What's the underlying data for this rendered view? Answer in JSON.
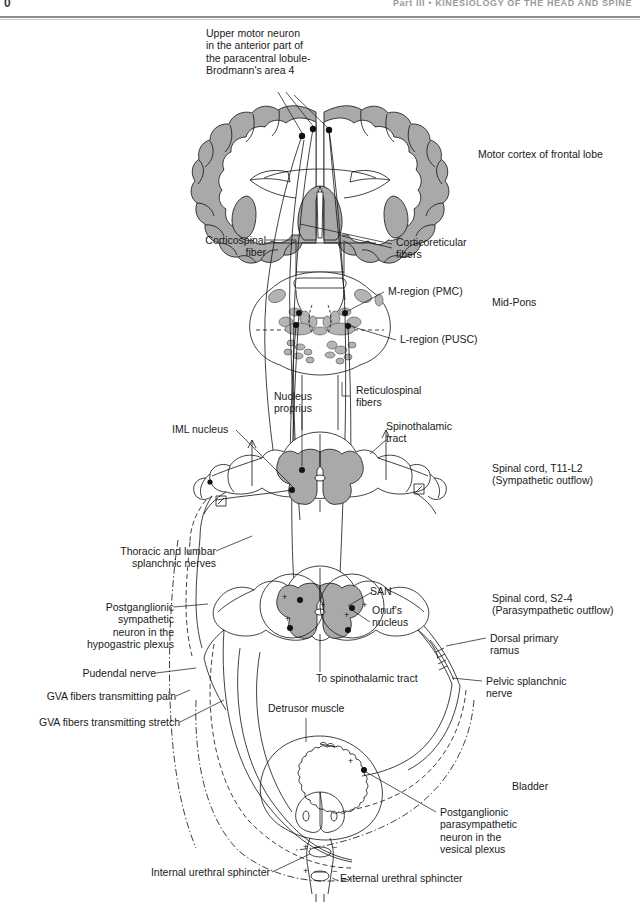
{
  "header": {
    "page_number": "0",
    "running_head": "Part III • KINESIOLOGY OF THE HEAD AND SPINE"
  },
  "figure": {
    "gray_fill_color": "#a9a9a9",
    "line_color": "#111111",
    "background_color": "#ffffff"
  },
  "labels": {
    "upper_motor_neuron": "Upper motor neuron\nin the anterior part of\nthe paracentral lobule-\nBrodmann's area 4",
    "motor_cortex": "Motor cortex of frontal lobe",
    "corticospinal_fiber": "Corticospinal\nfiber",
    "corticoreticular_fibers": "Corticoreticular\nfibers",
    "m_region": "M-region (PMC)",
    "l_region": "L-region (PUSC)",
    "mid_pons": "Mid-Pons",
    "nucleus_proprius": "Nucleus\nproprius",
    "reticulospinal_fibers": "Reticulospinal\nfibers",
    "iml_nucleus": "IML nucleus",
    "spinothalamic_tract": "Spinothalamic\ntract",
    "spinal_cord_t11_l2": "Spinal cord, T11-L2\n(Sympathetic outflow)",
    "thoracic_lumbar_splanchnic": "Thoracic and lumbar\nsplanchnic nerves",
    "postganglionic_sympathetic": "Postganglionic\nsympathetic\nneuron in the\nhypogastric plexus",
    "pudendal_nerve": "Pudendal nerve",
    "gva_pain": "GVA fibers transmitting pain",
    "gva_stretch": "GVA fibers transmitting stretch",
    "san": "SAN",
    "onufs_nucleus": "Onuf's\nnucleus",
    "spinal_cord_s2_4": "Spinal cord, S2-4\n(Parasympathetic outflow)",
    "dorsal_primary_ramus": "Dorsal primary\nramus",
    "to_spinothalamic_tract": "To spinothalamic tract",
    "pelvic_splanchnic_nerve": "Pelvic splanchnic\nnerve",
    "detrusor_muscle": "Detrusor muscle",
    "bladder": "Bladder",
    "postganglionic_parasympathetic": "Postganglionic\nparasympathetic\nneuron in the\nvesical plexus",
    "internal_urethral_sphincter": "Internal urethral sphincter",
    "external_urethral_sphincter": "External urethral sphincter"
  },
  "synapse_signs": {
    "plus": "+",
    "minus": "−"
  }
}
